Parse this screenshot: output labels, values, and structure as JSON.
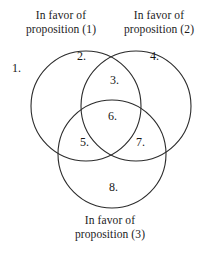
{
  "diagram": {
    "type": "venn-3-circle",
    "title_absent": true,
    "stroke_color": "#2b2b2b",
    "fill_color": "none",
    "background_color": "#ffffff",
    "text_color": "#171717"
  },
  "captions": {
    "set1": {
      "line1": "In favor of",
      "line2": "proposition (1)"
    },
    "set2": {
      "line1": "In favor of",
      "line2": "proposition (2)"
    },
    "set3": {
      "line1": "In favor of",
      "line2": "proposition (3)"
    }
  },
  "regions": [
    {
      "id": "1",
      "label": "1.",
      "meaning": "outside all three circles"
    },
    {
      "id": "2",
      "label": "2.",
      "meaning": "proposition (1) only"
    },
    {
      "id": "3",
      "label": "3.",
      "meaning": "proposition (1) and (2)"
    },
    {
      "id": "4",
      "label": "4.",
      "meaning": "proposition (2) only"
    },
    {
      "id": "5",
      "label": "5.",
      "meaning": "proposition (1) and (3)"
    },
    {
      "id": "6",
      "label": "6.",
      "meaning": "proposition (1), (2) and (3)"
    },
    {
      "id": "7",
      "label": "7.",
      "meaning": "proposition (2) and (3)"
    },
    {
      "id": "8",
      "label": "8.",
      "meaning": "proposition (3) only"
    }
  ],
  "circles": [
    {
      "name": "circle-proposition-1",
      "cx": 86,
      "cy": 106,
      "r": 55
    },
    {
      "name": "circle-proposition-2",
      "cx": 136,
      "cy": 106,
      "r": 55
    },
    {
      "name": "circle-proposition-3",
      "cx": 112,
      "cy": 154,
      "r": 54
    }
  ]
}
